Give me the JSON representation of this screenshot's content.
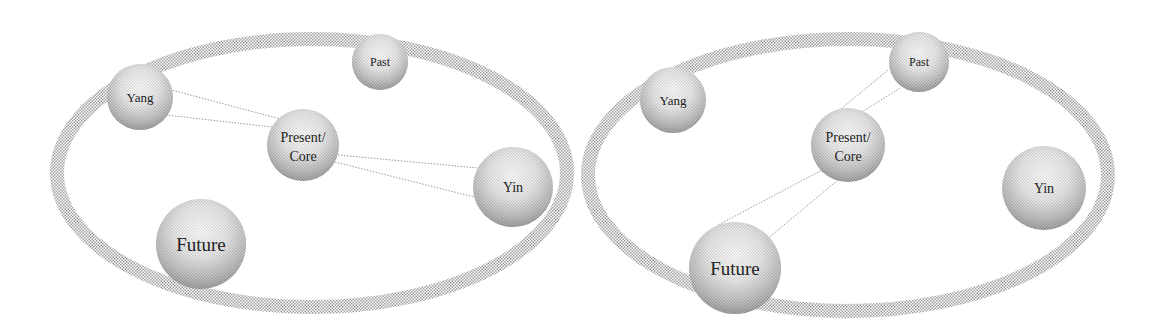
{
  "colors": {
    "ring": "#c8c8c8",
    "line": "#9a9a9a",
    "sphere_light": "#ffffff",
    "sphere_dark": "#8a8a8a",
    "text": "#222222"
  },
  "panels": [
    {
      "name": "left",
      "ring": {
        "cx": 312,
        "cy": 173,
        "rx": 255,
        "ry": 134
      },
      "nodes": {
        "yang": {
          "label": "Yang",
          "cx": 140,
          "cy": 97,
          "r": 33,
          "fs": 13
        },
        "past": {
          "label": "Past",
          "cx": 380,
          "cy": 62,
          "r": 28,
          "fs": 12
        },
        "present": {
          "label1": "Present/",
          "label2": "Core",
          "cx": 303,
          "cy": 145,
          "r": 36,
          "fs": 14
        },
        "yin": {
          "label": "Yin",
          "cx": 513,
          "cy": 187,
          "r": 40,
          "fs": 14
        },
        "future": {
          "label": "Future",
          "cx": 201,
          "cy": 244,
          "r": 45,
          "fs": 19
        }
      },
      "links": [
        {
          "x1": 164,
          "y1": 88,
          "x2": 284,
          "y2": 120
        },
        {
          "x1": 166,
          "y1": 115,
          "x2": 272,
          "y2": 127
        },
        {
          "x1": 338,
          "y1": 155,
          "x2": 478,
          "y2": 168
        },
        {
          "x1": 335,
          "y1": 162,
          "x2": 482,
          "y2": 199
        },
        {
          "x1": 478,
          "y1": 168,
          "x2": 548,
          "y2": 200
        },
        {
          "x1": 482,
          "y1": 199,
          "x2": 548,
          "y2": 200
        }
      ]
    },
    {
      "name": "right",
      "ring": {
        "cx": 848,
        "cy": 175,
        "rx": 260,
        "ry": 136
      },
      "nodes": {
        "yang": {
          "label": "Yang",
          "cx": 673,
          "cy": 100,
          "r": 33,
          "fs": 13
        },
        "past": {
          "label": "Past",
          "cx": 919,
          "cy": 62,
          "r": 30,
          "fs": 12
        },
        "present": {
          "label1": "Present/",
          "label2": "Core",
          "cx": 848,
          "cy": 145,
          "r": 37,
          "fs": 14
        },
        "yin": {
          "label": "Yin",
          "cx": 1044,
          "cy": 188,
          "r": 42,
          "fs": 14
        },
        "future": {
          "label": "Future",
          "cx": 735,
          "cy": 268,
          "r": 46,
          "fs": 19
        }
      },
      "links": [
        {
          "x1": 888,
          "y1": 70,
          "x2": 830,
          "y2": 118
        },
        {
          "x1": 900,
          "y1": 88,
          "x2": 862,
          "y2": 112
        },
        {
          "x1": 826,
          "y1": 168,
          "x2": 718,
          "y2": 225
        },
        {
          "x1": 838,
          "y1": 180,
          "x2": 760,
          "y2": 245
        }
      ]
    }
  ]
}
